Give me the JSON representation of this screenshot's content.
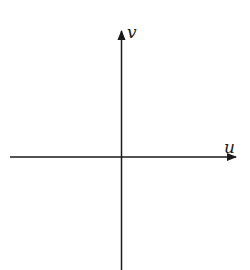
{
  "diagram": {
    "type": "coordinate-axes",
    "axes": {
      "horizontal_label": "u",
      "vertical_label": "v"
    },
    "colors": {
      "axis": "#1a1a1a",
      "background": "#ffffff"
    }
  }
}
